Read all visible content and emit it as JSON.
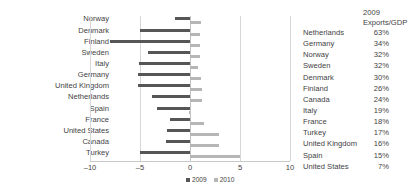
{
  "chart_data": {
    "type": "bar",
    "orientation": "horizontal",
    "title": "",
    "xlabel": "",
    "ylabel": "",
    "xlim": [
      -10,
      10
    ],
    "xticks": [
      -10,
      -5,
      0,
      5,
      10
    ],
    "xtick_labels": [
      "–10",
      "–5",
      "0",
      "5",
      "10"
    ],
    "grid": true,
    "legend_position": "bottom-center",
    "categories": [
      "Norway",
      "Denmark",
      "Finland",
      "Sweden",
      "Italy",
      "Germany",
      "United Kingdom",
      "Netherlands",
      "Spain",
      "France",
      "United States",
      "Canada",
      "Turkey"
    ],
    "series": [
      {
        "name": "2009",
        "color": "#565656",
        "values": [
          -1.5,
          -5.0,
          -8.0,
          -4.2,
          -5.1,
          -5.2,
          -5.2,
          -3.8,
          -3.3,
          -2.0,
          -2.3,
          -2.4,
          -5.0
        ]
      },
      {
        "name": "2010",
        "color": "#b6b6b6",
        "values": [
          1.1,
          1.0,
          1.0,
          1.0,
          0.8,
          1.1,
          1.2,
          1.2,
          -0.1,
          1.4,
          2.9,
          2.9,
          5.0
        ]
      }
    ]
  },
  "legend": {
    "items": [
      {
        "label": "2009",
        "color": "#565656"
      },
      {
        "label": "2010",
        "color": "#b6b6b6"
      }
    ]
  },
  "side_table": {
    "header": {
      "line1": "2009",
      "line2": "Exports/GDP"
    },
    "rows": [
      {
        "country": "Netherlands",
        "value": "63%"
      },
      {
        "country": "Germany",
        "value": "34%"
      },
      {
        "country": "Norway",
        "value": "32%"
      },
      {
        "country": "Sweden",
        "value": "32%"
      },
      {
        "country": "Denmark",
        "value": "30%"
      },
      {
        "country": "Finland",
        "value": "26%"
      },
      {
        "country": "Canada",
        "value": "24%"
      },
      {
        "country": "Italy",
        "value": "19%"
      },
      {
        "country": "France",
        "value": "18%"
      },
      {
        "country": "Turkey",
        "value": "17%"
      },
      {
        "country": "United Kingdom",
        "value": "16%"
      },
      {
        "country": "Spain",
        "value": "15%"
      },
      {
        "country": "United States",
        "value": "7%"
      }
    ]
  }
}
